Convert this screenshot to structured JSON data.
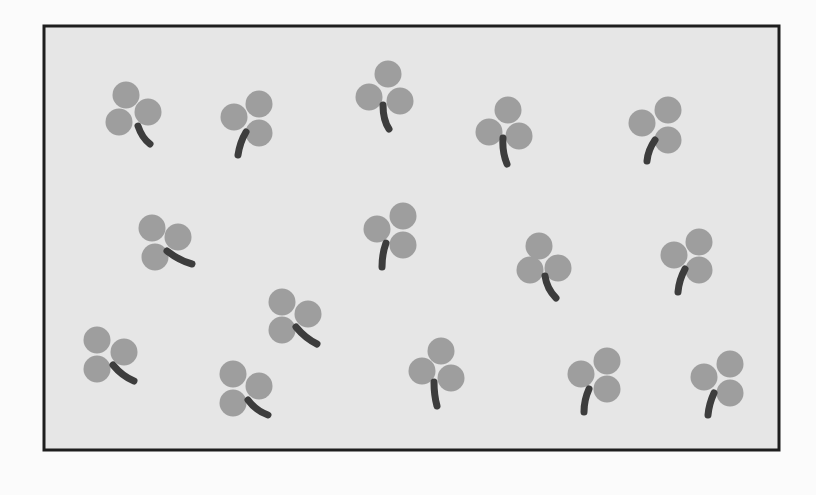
{
  "canvas": {
    "width": 816,
    "height": 495,
    "page_bg": "#fbfbfb"
  },
  "frame": {
    "x": 44,
    "y": 26,
    "width": 735,
    "height": 424,
    "fill": "#e6e6e6",
    "stroke": "#1e1e1e",
    "stroke_width": 3
  },
  "colors": {
    "leaf": "#9e9e9e",
    "stem": "#3d3d3d"
  },
  "leaf_radius": 13.5,
  "stem_width": 7,
  "clovers": [
    {
      "leaves": [
        [
          126,
          95
        ],
        [
          148,
          112
        ],
        [
          119,
          122
        ]
      ],
      "stem": [
        [
          138,
          126
        ],
        [
          142,
          138
        ],
        [
          150,
          144
        ]
      ]
    },
    {
      "leaves": [
        [
          259,
          104
        ],
        [
          234,
          117
        ],
        [
          259,
          133
        ]
      ],
      "stem": [
        [
          246,
          132
        ],
        [
          240,
          142
        ],
        [
          238,
          155
        ]
      ]
    },
    {
      "leaves": [
        [
          388,
          74
        ],
        [
          369,
          97
        ],
        [
          400,
          101
        ]
      ],
      "stem": [
        [
          383,
          105
        ],
        [
          383,
          120
        ],
        [
          389,
          129
        ]
      ]
    },
    {
      "leaves": [
        [
          508,
          110
        ],
        [
          489,
          132
        ],
        [
          519,
          136
        ]
      ],
      "stem": [
        [
          503,
          138
        ],
        [
          502,
          152
        ],
        [
          507,
          164
        ]
      ]
    },
    {
      "leaves": [
        [
          668,
          110
        ],
        [
          642,
          123
        ],
        [
          668,
          140
        ]
      ],
      "stem": [
        [
          655,
          140
        ],
        [
          648,
          150
        ],
        [
          647,
          161
        ]
      ]
    },
    {
      "leaves": [
        [
          152,
          228
        ],
        [
          178,
          237
        ],
        [
          155,
          257
        ]
      ],
      "stem": [
        [
          167,
          251
        ],
        [
          180,
          261
        ],
        [
          192,
          264
        ]
      ]
    },
    {
      "leaves": [
        [
          403,
          216
        ],
        [
          377,
          229
        ],
        [
          403,
          245
        ]
      ],
      "stem": [
        [
          386,
          243
        ],
        [
          382,
          254
        ],
        [
          382,
          267
        ]
      ]
    },
    {
      "leaves": [
        [
          539,
          246
        ],
        [
          530,
          270
        ],
        [
          558,
          268
        ]
      ],
      "stem": [
        [
          545,
          276
        ],
        [
          547,
          289
        ],
        [
          556,
          298
        ]
      ]
    },
    {
      "leaves": [
        [
          699,
          242
        ],
        [
          674,
          255
        ],
        [
          699,
          270
        ]
      ],
      "stem": [
        [
          685,
          269
        ],
        [
          679,
          280
        ],
        [
          678,
          292
        ]
      ]
    },
    {
      "leaves": [
        [
          282,
          302
        ],
        [
          308,
          314
        ],
        [
          282,
          330
        ]
      ],
      "stem": [
        [
          296,
          327
        ],
        [
          305,
          338
        ],
        [
          317,
          344
        ]
      ]
    },
    {
      "leaves": [
        [
          97,
          340
        ],
        [
          124,
          352
        ],
        [
          97,
          369
        ]
      ],
      "stem": [
        [
          113,
          365
        ],
        [
          122,
          376
        ],
        [
          134,
          381
        ]
      ]
    },
    {
      "leaves": [
        [
          441,
          351
        ],
        [
          422,
          371
        ],
        [
          451,
          378
        ]
      ],
      "stem": [
        [
          434,
          382
        ],
        [
          434,
          395
        ],
        [
          437,
          406
        ]
      ]
    },
    {
      "leaves": [
        [
          607,
          361
        ],
        [
          581,
          374
        ],
        [
          607,
          389
        ]
      ],
      "stem": [
        [
          589,
          389
        ],
        [
          584,
          400
        ],
        [
          584,
          412
        ]
      ]
    },
    {
      "leaves": [
        [
          233,
          374
        ],
        [
          259,
          386
        ],
        [
          233,
          403
        ]
      ],
      "stem": [
        [
          248,
          400
        ],
        [
          256,
          411
        ],
        [
          268,
          415
        ]
      ]
    },
    {
      "leaves": [
        [
          730,
          364
        ],
        [
          704,
          377
        ],
        [
          730,
          393
        ]
      ],
      "stem": [
        [
          714,
          393
        ],
        [
          709,
          404
        ],
        [
          708,
          415
        ]
      ]
    }
  ]
}
